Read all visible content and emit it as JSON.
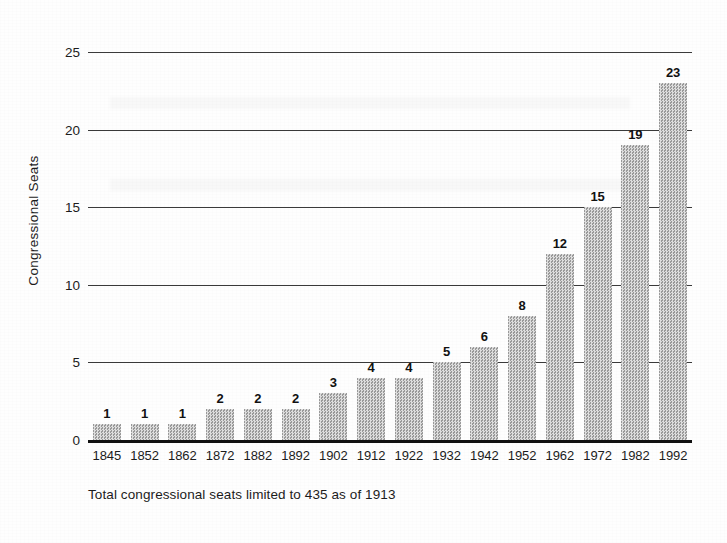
{
  "chart_data": {
    "type": "bar",
    "title": "",
    "subtitle": "",
    "xlabel": "",
    "ylabel": "Congressional Seats",
    "categories": [
      "1845",
      "1852",
      "1862",
      "1872",
      "1882",
      "1892",
      "1902",
      "1912",
      "1922",
      "1932",
      "1942",
      "1952",
      "1962",
      "1972",
      "1982",
      "1992"
    ],
    "values": [
      1,
      1,
      1,
      2,
      2,
      2,
      3,
      4,
      4,
      5,
      6,
      8,
      12,
      15,
      19,
      23
    ],
    "data_labels": [
      "1",
      "1",
      "1",
      "2",
      "2",
      "2",
      "3",
      "4",
      "4",
      "5",
      "6",
      "8",
      "12",
      "15",
      "19",
      "23"
    ],
    "ylim": [
      0,
      25
    ],
    "yticks": [
      0,
      5,
      10,
      15,
      20,
      25
    ],
    "ytick_labels": [
      "0",
      "5",
      "10",
      "15",
      "20",
      "25"
    ],
    "grid": "horizontal",
    "legend": "none",
    "bar_color": "#b4b4b4",
    "axis_color": "#111111",
    "gridline_color": "#3a3a3a",
    "text_color": "#1c1c1c",
    "annotation": "Total congressional seats limited to 435 as of 1913"
  },
  "caption": {
    "text": "Total congressional seats limited to 435 as of 1913"
  }
}
